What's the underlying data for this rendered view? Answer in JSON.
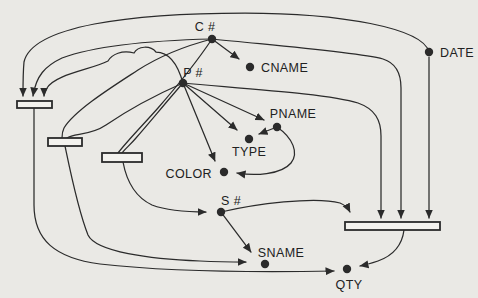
{
  "diagram": {
    "kind": "functional-dependency-diagram",
    "width": 478,
    "height": 298,
    "background_color": "#eae9e5",
    "ink_color": "#2b2b2b",
    "bar_fill_color": "#f3f2ee",
    "nodes": [
      {
        "id": "c-number",
        "label": "C #",
        "x": 212,
        "y": 39,
        "label_x": 205,
        "label_y": 31,
        "anchor": "middle"
      },
      {
        "id": "cname",
        "label": "CNAME",
        "x": 250,
        "y": 67,
        "label_x": 261,
        "label_y": 72,
        "anchor": "start"
      },
      {
        "id": "date",
        "label": "DATE",
        "x": 429,
        "y": 52,
        "label_x": 440,
        "label_y": 57,
        "anchor": "start"
      },
      {
        "id": "p-number",
        "label": "P #",
        "x": 183,
        "y": 83,
        "label_x": 193,
        "label_y": 77,
        "anchor": "middle"
      },
      {
        "id": "pname",
        "label": "PNAME",
        "x": 277,
        "y": 127,
        "label_x": 293,
        "label_y": 118,
        "anchor": "middle"
      },
      {
        "id": "type",
        "label": "TYPE",
        "x": 249,
        "y": 139,
        "label_x": 249,
        "label_y": 156,
        "anchor": "middle"
      },
      {
        "id": "color",
        "label": "COLOR",
        "x": 224,
        "y": 172,
        "label_x": 212,
        "label_y": 178,
        "anchor": "end"
      },
      {
        "id": "s-number",
        "label": "S #",
        "x": 221,
        "y": 212,
        "label_x": 231,
        "label_y": 205,
        "anchor": "middle"
      },
      {
        "id": "sname",
        "label": "SNAME",
        "x": 265,
        "y": 264,
        "label_x": 281,
        "label_y": 257,
        "anchor": "middle"
      },
      {
        "id": "qty",
        "label": "QTY",
        "x": 347,
        "y": 269,
        "label_x": 349,
        "label_y": 289,
        "anchor": "middle"
      }
    ],
    "bars": [
      {
        "id": "bar-left-top",
        "x": 17,
        "y": 101,
        "w": 35,
        "h": 7
      },
      {
        "id": "bar-left-mid",
        "x": 48,
        "y": 138,
        "w": 34,
        "h": 8
      },
      {
        "id": "bar-left-lower",
        "x": 102,
        "y": 153,
        "w": 40,
        "h": 9
      },
      {
        "id": "bar-right",
        "x": 345,
        "y": 222,
        "w": 95,
        "h": 8
      }
    ],
    "edges": [
      {
        "id": "c-to-cname",
        "from": "c-number",
        "to": "cname",
        "arrow": true,
        "path": "M 212 39 L 239 59"
      },
      {
        "id": "c-to-bar1",
        "from": "c-number",
        "to": "bar-left-top",
        "arrow": true,
        "path": "M 212 39 C 170 40 100 44 62 58 C 45 66 36 76 33 96"
      },
      {
        "id": "date-to-bar1",
        "from": "date",
        "to": "bar-left-top",
        "arrow": true,
        "path": "M 429 52 C 423 28 340 13 245 13 C 130 13 32 26 24 62 C 23 72 23 84 23 96"
      },
      {
        "id": "p-to-bar1",
        "from": "p-number",
        "to": "bar-left-top",
        "arrow": true,
        "path": "M 183 83 C 178 65 170 52 156 52 C 150 45 138 46 134 53 C 122 50 112 54 108 61 C 90 70 56 74 47 88 C 44 92 44 94 44 96"
      },
      {
        "id": "c-to-bar2",
        "from": "c-number",
        "to": "bar-left-mid",
        "arrow": false,
        "path": "M 212 39 C 185 46 160 56 138 70 C 112 87 75 110 64 128 C 62 132 62 134 62 138"
      },
      {
        "id": "p-to-bar2",
        "from": "p-number",
        "to": "bar-left-mid",
        "arrow": false,
        "path": "M 183 83 C 158 94 128 110 106 125 C 90 136 74 133 67 138"
      },
      {
        "id": "c-to-bar3",
        "from": "c-number",
        "to": "bar-left-lower",
        "arrow": false,
        "path": "M 212 39 C 198 60 178 85 158 108 C 143 125 128 140 118 153"
      },
      {
        "id": "p-to-bar3",
        "from": "p-number",
        "to": "bar-left-lower",
        "arrow": false,
        "path": "M 183 83 C 168 100 150 122 136 138 C 130 145 125 149 122 153"
      },
      {
        "id": "p-to-pname",
        "from": "p-number",
        "to": "pname",
        "arrow": true,
        "path": "M 183 83 L 264 120"
      },
      {
        "id": "p-to-type",
        "from": "p-number",
        "to": "type",
        "arrow": true,
        "path": "M 183 83 L 237 130"
      },
      {
        "id": "p-to-color",
        "from": "p-number",
        "to": "color",
        "arrow": true,
        "path": "M 183 83 L 215 161"
      },
      {
        "id": "pname-to-type",
        "from": "pname",
        "to": "type",
        "arrow": true,
        "path": "M 277 127 L 259 134"
      },
      {
        "id": "pname-to-color",
        "from": "pname",
        "to": "color",
        "arrow": true,
        "path": "M 277 127 C 293 138 299 153 291 163 C 281 175 254 176 237 173"
      },
      {
        "id": "s-to-sname",
        "from": "s-number",
        "to": "sname",
        "arrow": true,
        "path": "M 221 212 L 251 252"
      },
      {
        "id": "p-to-bar4",
        "from": "p-number",
        "to": "bar-right",
        "arrow": true,
        "path": "M 183 83 C 250 89 330 94 358 103 C 375 109 381 120 381 136 L 381 218"
      },
      {
        "id": "c-to-bar4",
        "from": "c-number",
        "to": "bar-right",
        "arrow": true,
        "path": "M 212 39 C 280 46 355 52 383 59 C 396 63 401 73 401 88 L 401 218"
      },
      {
        "id": "date-to-bar4",
        "from": "date",
        "to": "bar-right",
        "arrow": true,
        "path": "M 429 57 L 429 218"
      },
      {
        "id": "s-to-bar4",
        "from": "s-number",
        "to": "bar-right",
        "arrow": true,
        "path": "M 221 212 C 255 204 315 196 340 203 C 345 205 348 208 350 212"
      },
      {
        "id": "bar1-to-qty",
        "from": "bar-left-top",
        "to": "qty",
        "arrow": true,
        "path": "M 34 108 L 34 205 C 34 240 55 258 100 264 C 180 273 280 272 334 271"
      },
      {
        "id": "bar2-to-sname",
        "from": "bar-left-mid",
        "to": "sname",
        "arrow": true,
        "path": "M 65 146 C 70 170 78 210 88 235 C 96 252 150 259 200 261 C 220 262 236 262 246 262"
      },
      {
        "id": "bar3-to-s",
        "from": "bar-left-lower",
        "to": "s-number",
        "arrow": true,
        "path": "M 123 162 C 126 178 133 196 152 205 C 168 211 190 212 206 212"
      },
      {
        "id": "bar4-to-qty",
        "from": "bar-right",
        "to": "qty",
        "arrow": true,
        "path": "M 404 230 C 402 246 392 256 378 261 C 372 263 365 265 360 266"
      }
    ]
  }
}
